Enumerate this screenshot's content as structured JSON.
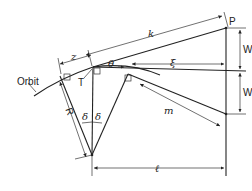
{
  "diagram": {
    "type": "geometry",
    "labels": {
      "orbit": "Orbit",
      "z": "z",
      "k": "k",
      "P": "P",
      "W_upper": "W",
      "W_lower": "W",
      "theta": "θ",
      "xi": "ξ",
      "T": "T",
      "R": "R",
      "delta_left": "δ",
      "delta_right": "δ",
      "m": "m",
      "l": "ℓ"
    },
    "colors": {
      "line": "#222222",
      "background": "#ffffff"
    }
  }
}
